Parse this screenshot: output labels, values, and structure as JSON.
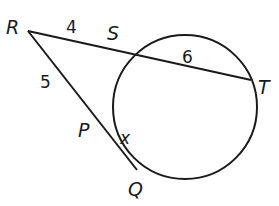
{
  "diagram": {
    "type": "secant-secant",
    "points": {
      "R": {
        "label": "R",
        "x": 28,
        "y": 31
      },
      "S": {
        "label": "S",
        "x": 117,
        "y": 50
      },
      "T": {
        "label": "T",
        "x": 251,
        "y": 80
      },
      "P": {
        "label": "P",
        "x": 97,
        "y": 120
      },
      "Q": {
        "label": "Q",
        "x": 137,
        "y": 170
      }
    },
    "circle": {
      "cx": 185,
      "cy": 107,
      "r": 72
    },
    "segments": {
      "RS": "4",
      "ST": "6",
      "RP": "5",
      "PQ": "x"
    },
    "colors": {
      "stroke": "#1a1a1a",
      "background": "#ffffff"
    }
  }
}
